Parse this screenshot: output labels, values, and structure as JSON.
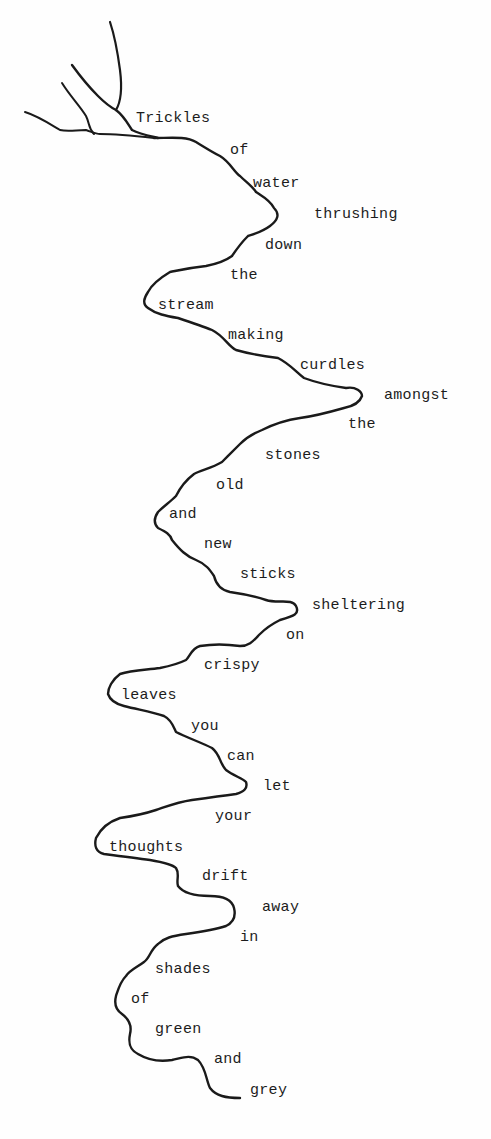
{
  "poem": {
    "words": [
      {
        "text": "Trickles",
        "x": 136,
        "y": 111
      },
      {
        "text": "of",
        "x": 230,
        "y": 143
      },
      {
        "text": "water",
        "x": 253,
        "y": 176
      },
      {
        "text": "thrushing",
        "x": 314,
        "y": 207
      },
      {
        "text": "down",
        "x": 265,
        "y": 238
      },
      {
        "text": "the",
        "x": 230,
        "y": 268
      },
      {
        "text": "stream",
        "x": 158,
        "y": 298
      },
      {
        "text": "making",
        "x": 228,
        "y": 328
      },
      {
        "text": "curdles",
        "x": 300,
        "y": 358
      },
      {
        "text": "amongst",
        "x": 384,
        "y": 388
      },
      {
        "text": "the",
        "x": 348,
        "y": 417
      },
      {
        "text": "stones",
        "x": 265,
        "y": 448
      },
      {
        "text": "old",
        "x": 216,
        "y": 478
      },
      {
        "text": "and",
        "x": 169,
        "y": 507
      },
      {
        "text": "new",
        "x": 204,
        "y": 537
      },
      {
        "text": "sticks",
        "x": 240,
        "y": 567
      },
      {
        "text": "sheltering",
        "x": 312,
        "y": 598
      },
      {
        "text": "on",
        "x": 286,
        "y": 628
      },
      {
        "text": "crispy",
        "x": 204,
        "y": 658
      },
      {
        "text": "leaves",
        "x": 121,
        "y": 688
      },
      {
        "text": "you",
        "x": 191,
        "y": 719
      },
      {
        "text": "can",
        "x": 227,
        "y": 749
      },
      {
        "text": "let",
        "x": 263,
        "y": 779
      },
      {
        "text": "your",
        "x": 215,
        "y": 809
      },
      {
        "text": "thoughts",
        "x": 109,
        "y": 840
      },
      {
        "text": "drift",
        "x": 202,
        "y": 869
      },
      {
        "text": "away",
        "x": 262,
        "y": 900
      },
      {
        "text": "in",
        "x": 240,
        "y": 930
      },
      {
        "text": "shades",
        "x": 155,
        "y": 962
      },
      {
        "text": "of",
        "x": 131,
        "y": 992
      },
      {
        "text": "green",
        "x": 155,
        "y": 1022
      },
      {
        "text": "and",
        "x": 214,
        "y": 1052
      },
      {
        "text": "grey",
        "x": 250,
        "y": 1083
      }
    ]
  }
}
